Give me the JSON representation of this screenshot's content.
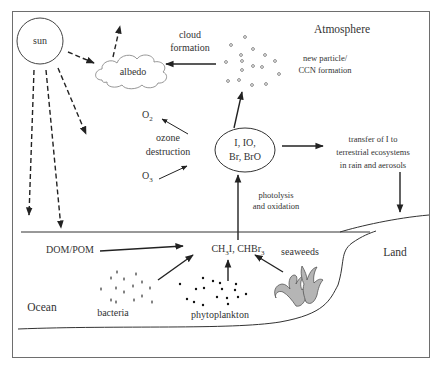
{
  "diagram": {
    "regions": {
      "atmosphere": "Atmosphere",
      "land": "Land",
      "ocean": "Ocean"
    },
    "nodes": {
      "sun": "sun",
      "albedo": "albedo",
      "halogen_species": {
        "line1": "I, IO,",
        "line2": "Br, BrO"
      },
      "o2": {
        "base": "O",
        "sub": "2"
      },
      "o3": {
        "base": "O",
        "sub": "3"
      },
      "ozone_destruction": {
        "line1": "ozone",
        "line2": "destruction"
      },
      "cloud_formation": {
        "line1": "cloud",
        "line2": "formation"
      },
      "new_particle": {
        "line1": "new particle/",
        "line2": "CCN formation"
      },
      "transfer": {
        "line1": "transfer of I to",
        "line2": "terrestrial ecosystems",
        "line3": "in rain and aerosols"
      },
      "photolysis": {
        "line1": "photolysis",
        "line2": "and oxidation"
      },
      "emissions": {
        "part1": "CH",
        "sub1": "3",
        "part2": "I, CHBr",
        "sub2": "3"
      },
      "dom_pom": "DOM/POM",
      "bacteria": "bacteria",
      "phytoplankton": "phytoplankton",
      "seaweeds": "seaweeds"
    },
    "colors": {
      "line": "#2a2a2a",
      "text": "#333333",
      "cloud_stroke": "#8a8a8a",
      "seaweed_fill": "#b5b5b5",
      "border": "#6e6e6e"
    }
  }
}
